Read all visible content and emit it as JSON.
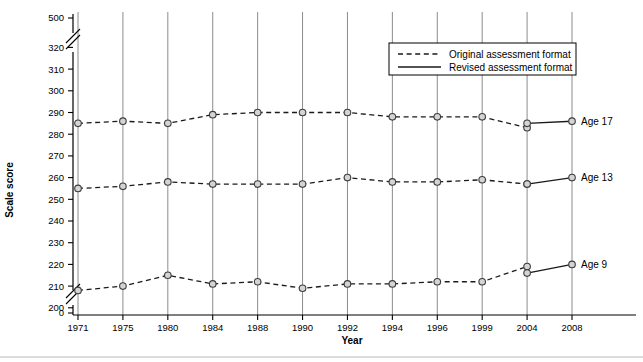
{
  "chart_data": {
    "type": "line",
    "title": "",
    "xlabel": "Year",
    "ylabel": "Scale score",
    "categories": [
      "1971",
      "1975",
      "1980",
      "1984",
      "1988",
      "1990",
      "1992",
      "1994",
      "1996",
      "1999",
      "2004",
      "2008"
    ],
    "ytick_labels": [
      "500",
      "320",
      "310",
      "300",
      "290",
      "280",
      "270",
      "260",
      "250",
      "240",
      "230",
      "220",
      "210",
      "200",
      "0"
    ],
    "ylim": [
      200,
      320
    ],
    "axis_breaks": [
      "between 320 and 500",
      "between 0 and 200"
    ],
    "grid": "vertical gridlines at each year",
    "legend_position": "top-right inside plot",
    "legend": [
      {
        "label": "Original assessment format",
        "style": "dashed"
      },
      {
        "label": "Revised assessment format",
        "style": "solid"
      }
    ],
    "series": [
      {
        "name": "Age 17",
        "label": "Age 17",
        "original": {
          "x": [
            "1971",
            "1975",
            "1980",
            "1984",
            "1988",
            "1990",
            "1992",
            "1994",
            "1996",
            "1999",
            "2004"
          ],
          "values": [
            285,
            286,
            285,
            289,
            290,
            290,
            290,
            288,
            288,
            288,
            283
          ]
        },
        "revised": {
          "x": [
            "2004",
            "2008"
          ],
          "values": [
            285,
            286
          ]
        }
      },
      {
        "name": "Age 13",
        "label": "Age 13",
        "original": {
          "x": [
            "1971",
            "1975",
            "1980",
            "1984",
            "1988",
            "1990",
            "1992",
            "1994",
            "1996",
            "1999",
            "2004"
          ],
          "values": [
            255,
            256,
            258,
            257,
            257,
            257,
            260,
            258,
            258,
            259,
            257
          ]
        },
        "revised": {
          "x": [
            "2004",
            "2008"
          ],
          "values": [
            257,
            260
          ]
        }
      },
      {
        "name": "Age 9",
        "label": "Age 9",
        "original": {
          "x": [
            "1971",
            "1975",
            "1980",
            "1984",
            "1988",
            "1990",
            "1992",
            "1994",
            "1996",
            "1999",
            "2004"
          ],
          "values": [
            208,
            210,
            215,
            211,
            212,
            209,
            211,
            211,
            212,
            212,
            219
          ]
        },
        "revised": {
          "x": [
            "2004",
            "2008"
          ],
          "values": [
            216,
            220
          ]
        }
      }
    ]
  },
  "colors": {
    "line": "#1a1a1a",
    "marker_fill": "#d4d4d4",
    "marker_stroke": "#3d3d3d",
    "gridline": "#8c8c8c",
    "axis": "#000000",
    "background": "#ffffff"
  }
}
